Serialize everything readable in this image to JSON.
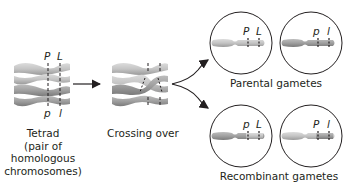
{
  "diagram": {
    "stages": [
      {
        "id": "tetrad",
        "label_lines": [
          "Tetrad",
          "(pair of",
          "homologous",
          "chromosomes)"
        ],
        "gene_labels_top": [
          "P",
          "L"
        ],
        "gene_labels_bottom": [
          "p",
          "l"
        ]
      },
      {
        "id": "crossing-over",
        "label": "Crossing over"
      }
    ],
    "gametes": {
      "parental": {
        "label": "Parental gametes",
        "cells": [
          {
            "alleles": [
              "P",
              "L"
            ]
          },
          {
            "alleles": [
              "p",
              "l"
            ]
          }
        ]
      },
      "recombinant": {
        "label": "Recombinant gametes",
        "cells": [
          {
            "alleles": [
              "p",
              "L"
            ]
          },
          {
            "alleles": [
              "P",
              "l"
            ]
          }
        ]
      }
    },
    "colors": {
      "chromatid_light": "#c8c8c8",
      "chromatid_dark": "#a6a6a6",
      "outline": "#231f20",
      "arrow": "#231f20"
    }
  }
}
